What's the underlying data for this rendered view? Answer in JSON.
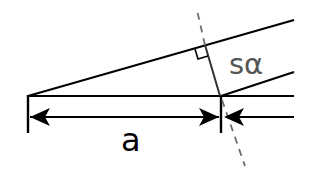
{
  "diagram": {
    "labels": {
      "distance": "a",
      "projection": "sα"
    },
    "colors": {
      "line": "#000000",
      "dashed": "#6b6b6b",
      "projection_label": "#555555",
      "background": "#ffffff"
    },
    "elements": [
      "baseline",
      "upper-slanted-line",
      "lower-slanted-line",
      "left-tick",
      "right-tick",
      "perpendicular-segment",
      "dashed-extension",
      "right-angle-marker",
      "double-arrow-a",
      "incoming-arrow-right"
    ]
  }
}
